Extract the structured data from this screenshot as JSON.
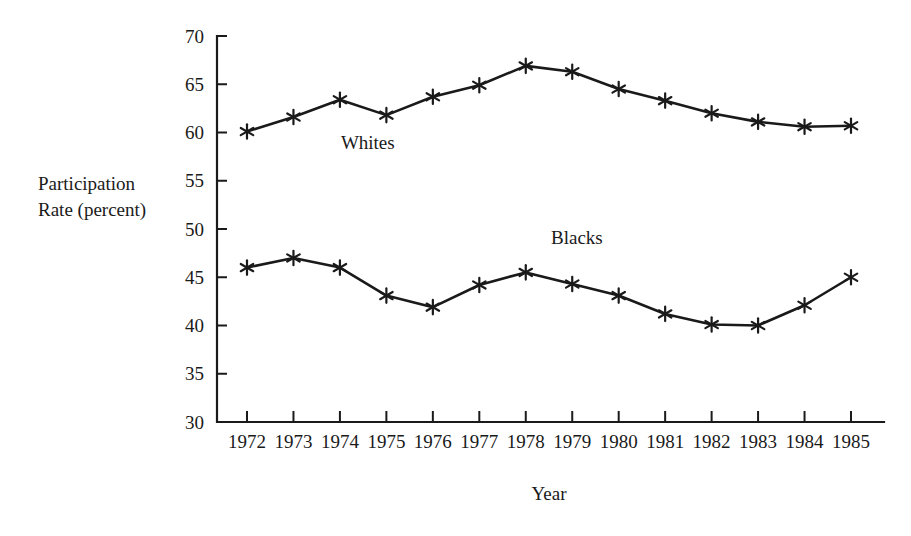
{
  "chart_data": {
    "type": "line",
    "title": "",
    "xlabel": "Year",
    "ylabel": "Participation Rate (percent)",
    "ylabel_line1": "Participation",
    "ylabel_line2": "Rate (percent)",
    "categories": [
      "1972",
      "1973",
      "1974",
      "1975",
      "1976",
      "1977",
      "1978",
      "1979",
      "1980",
      "1981",
      "1982",
      "1983",
      "1984",
      "1985"
    ],
    "x": [
      1972,
      1973,
      1974,
      1975,
      1976,
      1977,
      1978,
      1979,
      1980,
      1981,
      1982,
      1983,
      1984,
      1985
    ],
    "ylim": [
      30,
      70
    ],
    "yticks": [
      30,
      35,
      40,
      45,
      50,
      55,
      60,
      65,
      70
    ],
    "ytick_labels": [
      "30",
      "35",
      "40",
      "45",
      "50",
      "55",
      "60",
      "65",
      "70"
    ],
    "grid": false,
    "legend_position": "inline-annotations",
    "marker": "asterisk",
    "line_color": "#1a1a1a",
    "series": [
      {
        "name": "Whites",
        "label_text": "Whites",
        "values": [
          60.1,
          61.6,
          63.4,
          61.8,
          63.7,
          64.9,
          66.9,
          66.3,
          64.5,
          63.3,
          62.0,
          61.1,
          60.6,
          60.7
        ]
      },
      {
        "name": "Blacks",
        "label_text": "Blacks",
        "values": [
          46.0,
          47.0,
          46.0,
          43.1,
          41.9,
          44.2,
          45.5,
          44.3,
          43.1,
          41.2,
          40.1,
          40.0,
          42.1,
          45.0
        ]
      }
    ],
    "annotations": [
      {
        "text": "Whites",
        "x": 1974.6,
        "y": 58.3
      },
      {
        "text": "Blacks",
        "x": 1979.1,
        "y": 48.4
      }
    ]
  }
}
